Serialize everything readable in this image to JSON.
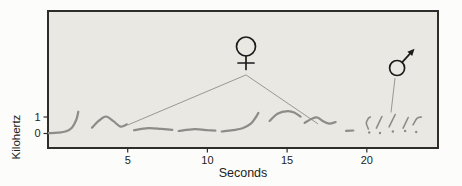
{
  "figure": {
    "description_role": "sound-spectrogram-figure",
    "xlabel": "Seconds",
    "ylabel": "Kilohertz"
  },
  "chart_data": {
    "type": "line",
    "title": "",
    "xlabel": "Seconds",
    "ylabel": "Kilohertz",
    "x_ticks": [
      5,
      10,
      15,
      20
    ],
    "y_ticks": [
      1,
      0
    ],
    "xlim": [
      0,
      24.5
    ],
    "ylim": [
      -0.9,
      7.4
    ],
    "grid": false,
    "units": {
      "x": "seconds",
      "y": "kilohertz"
    },
    "series": [
      {
        "name": "trace-segment-1",
        "points": [
          [
            0.05,
            0.02
          ],
          [
            0.6,
            0.05
          ],
          [
            1.1,
            0.12
          ],
          [
            1.5,
            0.35
          ],
          [
            1.78,
            0.85
          ],
          [
            1.9,
            1.32
          ]
        ]
      },
      {
        "name": "trace-segment-2",
        "points": [
          [
            2.76,
            0.36
          ],
          [
            3.2,
            0.78
          ],
          [
            3.64,
            1.03
          ],
          [
            4.1,
            0.75
          ],
          [
            4.55,
            0.42
          ],
          [
            4.95,
            0.55
          ]
        ]
      },
      {
        "name": "trace-segment-3",
        "points": [
          [
            5.4,
            0.2
          ],
          [
            6.3,
            0.33
          ],
          [
            7.1,
            0.28
          ],
          [
            7.8,
            0.22
          ]
        ]
      },
      {
        "name": "trace-segment-4",
        "points": [
          [
            8.2,
            0.15
          ],
          [
            9.2,
            0.26
          ],
          [
            10.0,
            0.2
          ],
          [
            10.5,
            0.17
          ]
        ]
      },
      {
        "name": "trace-segment-5",
        "points": [
          [
            10.9,
            0.12
          ],
          [
            11.6,
            0.2
          ],
          [
            12.2,
            0.32
          ],
          [
            12.75,
            0.62
          ],
          [
            13.05,
            1.0
          ],
          [
            13.2,
            1.25
          ]
        ]
      },
      {
        "name": "trace-segment-6",
        "points": [
          [
            13.9,
            0.76
          ],
          [
            14.4,
            1.2
          ],
          [
            15.05,
            1.36
          ],
          [
            15.5,
            1.25
          ],
          [
            15.85,
            1.02
          ]
        ]
      },
      {
        "name": "trace-segment-7",
        "points": [
          [
            16.1,
            0.64
          ],
          [
            16.55,
            0.9
          ],
          [
            16.9,
            0.97
          ],
          [
            17.3,
            0.72
          ],
          [
            17.65,
            0.6
          ],
          [
            18.05,
            0.7
          ]
        ]
      },
      {
        "name": "trace-segment-8",
        "points": [
          [
            18.7,
            0.16
          ],
          [
            19.15,
            0.18
          ]
        ]
      },
      {
        "name": "male-note-1",
        "points": [
          [
            20.1,
            0.28
          ],
          [
            19.97,
            0.62
          ],
          [
            20.08,
            0.9
          ],
          [
            20.22,
            1.0
          ]
        ]
      },
      {
        "name": "male-note-2",
        "points": [
          [
            20.6,
            0.33
          ],
          [
            20.95,
            1.03
          ]
        ]
      },
      {
        "name": "male-note-3",
        "points": [
          [
            21.4,
            0.4
          ],
          [
            21.78,
            1.15
          ]
        ]
      },
      {
        "name": "male-note-4",
        "points": [
          [
            22.28,
            0.33
          ],
          [
            22.6,
            0.97
          ]
        ]
      },
      {
        "name": "male-note-5",
        "points": [
          [
            22.9,
            0.52
          ],
          [
            23.15,
            0.92
          ],
          [
            23.42,
            1.0
          ]
        ]
      }
    ],
    "dots": [
      [
        20.15,
        0.06
      ],
      [
        20.83,
        0.03
      ],
      [
        21.64,
        0.12
      ],
      [
        22.4,
        0.15
      ],
      [
        23.1,
        0.09
      ]
    ],
    "annotations": [
      {
        "id": "female",
        "glyph": "female-sign",
        "symbol_char": "♀",
        "symbol_pos": [
          12.42,
          5.27
        ],
        "leader": {
          "apex": [
            12.42,
            3.55
          ],
          "ends": [
            [
              5.02,
              0.52
            ],
            [
              16.94,
              0.58
            ]
          ]
        }
      },
      {
        "id": "male",
        "glyph": "male-sign",
        "symbol_char": "♂",
        "symbol_pos": [
          21.9,
          3.97
        ],
        "leader": {
          "ends": [
            [
              21.77,
              3.36
            ],
            [
              21.52,
              1.27
            ]
          ]
        }
      }
    ],
    "colors": {
      "page_bg": "#fcfcfa",
      "plot_bg": "#e9e8e3",
      "border": "#2e2d2b",
      "trace": "#8d8c88",
      "leader": "#8f8e89",
      "symbol": "#1b1b1b",
      "text": "#232320"
    }
  }
}
